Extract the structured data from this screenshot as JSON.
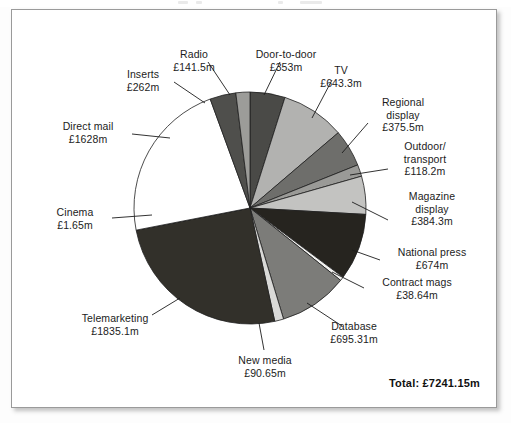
{
  "figure": {
    "total_label": "Total: £7241.15m",
    "currency_prefix": "£",
    "unit_suffix": "m"
  },
  "chart_data": {
    "type": "pie",
    "title": "",
    "subtitle": "",
    "xlabel": "",
    "ylabel": "",
    "legend_position": "callout-labels",
    "grid": false,
    "total": 7241.15,
    "total_display": "Total: £7241.15m",
    "units": "£ million",
    "start_angle_deg": 0,
    "direction": "clockwise",
    "categories": [
      "Door-to-door",
      "TV",
      "Regional display",
      "Outdoor/ transport",
      "Magazine display",
      "National press",
      "Contract mags",
      "Database",
      "New media",
      "Telemarketing",
      "Cinema",
      "Direct mail",
      "Inserts",
      "Radio"
    ],
    "values": [
      353,
      643.3,
      375.5,
      118.2,
      384.3,
      674,
      38.64,
      695.31,
      90.65,
      1835.1,
      1.65,
      1628,
      262,
      141.5
    ],
    "value_labels": [
      "£353m",
      "£643.3m",
      "£375.5m",
      "£118.2m",
      "£384.3m",
      "£674m",
      "£38.64m",
      "£695.31m",
      "£90.65m",
      "£1835.1m",
      "£1.65m",
      "£1628m",
      "£262m",
      "£141.5m"
    ],
    "slice_colors": [
      "#4a4a47",
      "#b2b2b0",
      "#6e6e6b",
      "#9a9a97",
      "#c3c3c1",
      "#26241f",
      "#f2f2f0",
      "#7c7c79",
      "#d9d9d7",
      "#32302a",
      "#e8e8e6",
      "#ffffff",
      "#4f4f4c",
      "#9c9c99"
    ],
    "slices": [
      {
        "label": "Door-to-door",
        "value": 353,
        "value_label": "£353m",
        "color": "#4a4a47"
      },
      {
        "label": "TV",
        "value": 643.3,
        "value_label": "£643.3m",
        "color": "#b2b2b0"
      },
      {
        "label": "Regional display",
        "value": 375.5,
        "value_label": "£375.5m",
        "color": "#6e6e6b"
      },
      {
        "label": "Outdoor/ transport",
        "value": 118.2,
        "value_label": "£118.2m",
        "color": "#9a9a97"
      },
      {
        "label": "Magazine display",
        "value": 384.3,
        "value_label": "£384.3m",
        "color": "#c3c3c1"
      },
      {
        "label": "National press",
        "value": 674,
        "value_label": "£674m",
        "color": "#26241f"
      },
      {
        "label": "Contract mags",
        "value": 38.64,
        "value_label": "£38.64m",
        "color": "#f2f2f0"
      },
      {
        "label": "Database",
        "value": 695.31,
        "value_label": "£695.31m",
        "color": "#7c7c79"
      },
      {
        "label": "New media",
        "value": 90.65,
        "value_label": "£90.65m",
        "color": "#d9d9d7"
      },
      {
        "label": "Telemarketing",
        "value": 1835.1,
        "value_label": "£1835.1m",
        "color": "#32302a"
      },
      {
        "label": "Cinema",
        "value": 1.65,
        "value_label": "£1.65m",
        "color": "#e8e8e6"
      },
      {
        "label": "Direct mail",
        "value": 1628,
        "value_label": "£1628m",
        "color": "#ffffff"
      },
      {
        "label": "Inserts",
        "value": 262,
        "value_label": "£262m",
        "color": "#4f4f4c"
      },
      {
        "label": "Radio",
        "value": 141.5,
        "value_label": "£141.5m",
        "color": "#9c9c99"
      }
    ]
  },
  "callouts": {
    "radio": {
      "name": "Radio",
      "value": "£141.5m"
    },
    "door_to_door": {
      "name": "Door-to-door",
      "value": "£353m"
    },
    "tv": {
      "name": "TV",
      "value": "£643.3m"
    },
    "inserts": {
      "name": "Inserts",
      "value": "£262m"
    },
    "regional": {
      "name": "Regional",
      "name2": "display",
      "value": "£375.5m"
    },
    "outdoor": {
      "name": "Outdoor/",
      "name2": "transport",
      "value": "£118.2m"
    },
    "magazine": {
      "name": "Magazine",
      "name2": "display",
      "value": "£384.3m"
    },
    "direct_mail": {
      "name": "Direct mail",
      "value": "£1628m"
    },
    "national": {
      "name": "National press",
      "value": "£674m"
    },
    "contract": {
      "name": "Contract mags",
      "value": "£38.64m"
    },
    "database": {
      "name": "Database",
      "value": "£695.31m"
    },
    "cinema": {
      "name": "Cinema",
      "value": "£1.65m"
    },
    "new_media": {
      "name": "New media",
      "value": "£90.65m"
    },
    "telemarketing": {
      "name": "Telemarketing",
      "value": "£1835.1m"
    }
  }
}
